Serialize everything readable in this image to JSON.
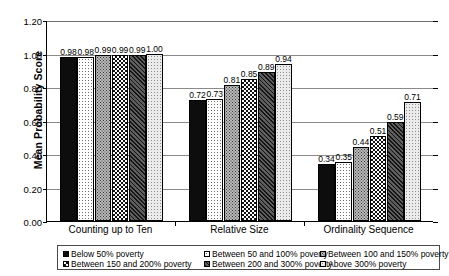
{
  "chart_data": {
    "type": "bar",
    "title": "",
    "xlabel": "",
    "ylabel": "Mean Probability Score",
    "ylim": [
      0.0,
      1.2
    ],
    "ytick_labels": [
      "0.00",
      "0.20",
      "0.40",
      "0.60",
      "0.80",
      "1.00",
      "1.20"
    ],
    "ytick_values": [
      0.0,
      0.2,
      0.4,
      0.6,
      0.8,
      1.0,
      1.2
    ],
    "grid": true,
    "legend_position": "bottom",
    "categories": [
      "Counting up to Ten",
      "Relative Size",
      "Ordinality Sequence"
    ],
    "series": [
      {
        "name": "Below 50% poverty",
        "values": [
          0.98,
          0.72,
          0.34
        ],
        "labels": [
          "0.98",
          "0.72",
          "0.34"
        ],
        "pattern": "solid-black"
      },
      {
        "name": "Between 50 and 100% poverty",
        "values": [
          0.98,
          0.73,
          0.35
        ],
        "labels": [
          "0.98",
          "0.73",
          "0.35"
        ],
        "pattern": "white-fine-dots"
      },
      {
        "name": "Between 100 and 150% poverty",
        "values": [
          0.99,
          0.81,
          0.44
        ],
        "labels": [
          "0.99",
          "0.81",
          "0.44"
        ],
        "pattern": "gray-dense-dots"
      },
      {
        "name": "Between 150 and 200% poverty",
        "values": [
          0.99,
          0.85,
          0.51
        ],
        "labels": [
          "0.99",
          "0.85",
          "0.51"
        ],
        "pattern": "checkerboard"
      },
      {
        "name": "Between 200 and 300% poverty",
        "values": [
          0.99,
          0.89,
          0.59
        ],
        "labels": [
          "0.99",
          "0.89",
          "0.59"
        ],
        "pattern": "dark-diagonal-hatch"
      },
      {
        "name": "Above 300% poverty",
        "values": [
          1.0,
          0.94,
          0.71
        ],
        "labels": [
          "1.00",
          "0.94",
          "0.71"
        ],
        "pattern": "light-gray-dots"
      }
    ]
  },
  "legend": {
    "items": [
      "Below 50% poverty",
      "Between 50 and 100% poverty",
      "Between 100 and 150% poverty",
      "Between 150 and 200% poverty",
      "Between 200 and 300% poverty",
      "Above 300% poverty"
    ]
  },
  "colors": {
    "axis": "#000000",
    "gridline": "#8a8a8a",
    "legend_border": "#4a4a4a",
    "background": "#ffffff"
  }
}
